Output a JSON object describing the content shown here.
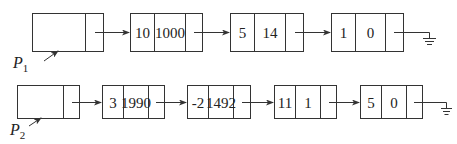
{
  "lists": [
    {
      "head_label": "P",
      "head_sub": "1",
      "nodes": [
        {
          "coef": "10",
          "exp": "1000"
        },
        {
          "coef": "5",
          "exp": "14"
        },
        {
          "coef": "1",
          "exp": "0"
        }
      ],
      "terminator": "null-ground-icon"
    },
    {
      "head_label": "P",
      "head_sub": "2",
      "nodes": [
        {
          "coef": "3",
          "exp": "1990"
        },
        {
          "coef": "-2",
          "exp": "1492"
        },
        {
          "coef": "11",
          "exp": "1"
        },
        {
          "coef": "5",
          "exp": "0"
        }
      ],
      "terminator": "null-ground-icon"
    }
  ],
  "colors": {
    "stroke": "#333333",
    "text": "#222222",
    "background": "#ffffff"
  }
}
